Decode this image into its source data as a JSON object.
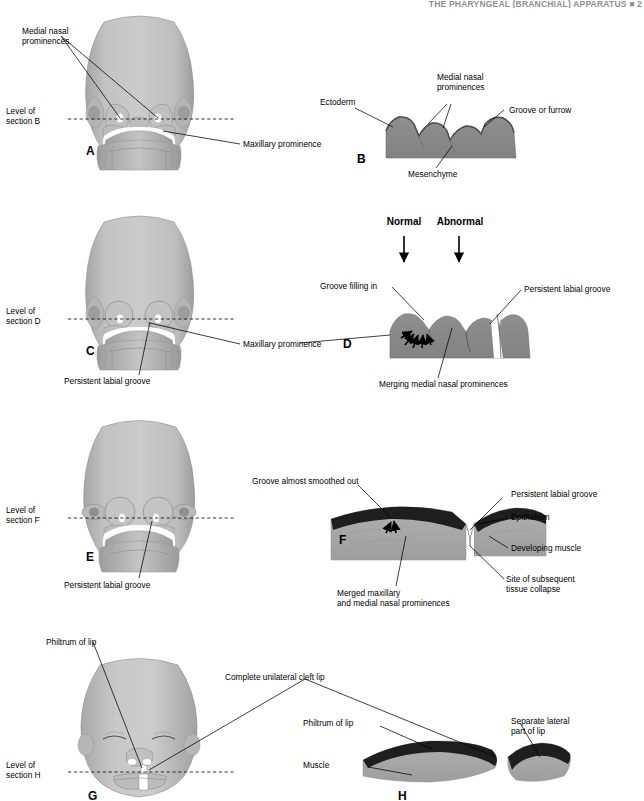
{
  "page": {
    "running_head": "THE PHARYNGEAL (BRANCHIAL) APPARATUS  ■  2",
    "background_color": "#ffffff",
    "ink_color": "#000000"
  },
  "palette": {
    "mesenchyme_gray": "#8a8a8a",
    "head_light_gray": "#c6c6c6",
    "head_mid_gray": "#b0b0b0",
    "head_shadow_gray": "#9a9a9a",
    "epithelium_dark": "#1e1e1e",
    "muscle_gray": "#a8a8a8",
    "label_black": "#000000"
  },
  "panels": [
    {
      "id": "A",
      "letter": "A",
      "type": "embryo-face-frontal",
      "labels": [
        {
          "name": "medial-nasal-prominences",
          "text": "Medial nasal\nprominences"
        },
        {
          "name": "level-of-section-b",
          "text": "Level of\nsection B"
        },
        {
          "name": "maxillary-prominence",
          "text": "Maxillary prominence"
        }
      ]
    },
    {
      "id": "B",
      "letter": "B",
      "type": "histology-cross-section",
      "labels": [
        {
          "name": "ectoderm",
          "text": "Ectoderm"
        },
        {
          "name": "medial-nasal-prominences",
          "text": "Medial nasal\nprominences"
        },
        {
          "name": "groove-or-furrow",
          "text": "Groove or furrow"
        },
        {
          "name": "mesenchyme",
          "text": "Mesenchyme"
        }
      ]
    },
    {
      "id": "C",
      "letter": "C",
      "type": "embryo-face-frontal",
      "labels": [
        {
          "name": "level-of-section-d",
          "text": "Level of\nsection D"
        },
        {
          "name": "maxillary-prominence",
          "text": "Maxillary prominence"
        },
        {
          "name": "persistent-labial-groove",
          "text": "Persistent labial groove"
        }
      ]
    },
    {
      "id": "D",
      "letter": "D",
      "type": "histology-cross-section",
      "headings": [
        {
          "name": "normal-heading",
          "text": "Normal"
        },
        {
          "name": "abnormal-heading",
          "text": "Abnormal"
        }
      ],
      "labels": [
        {
          "name": "groove-filling-in",
          "text": "Groove filling in"
        },
        {
          "name": "persistent-labial-groove",
          "text": "Persistent labial groove"
        },
        {
          "name": "merging-medial-nasal-prominences",
          "text": "Merging medial nasal prominences"
        }
      ]
    },
    {
      "id": "E",
      "letter": "E",
      "type": "embryo-face-frontal",
      "labels": [
        {
          "name": "level-of-section-f",
          "text": "Level of\nsection F"
        },
        {
          "name": "persistent-labial-groove",
          "text": "Persistent labial groove"
        }
      ]
    },
    {
      "id": "F",
      "letter": "F",
      "type": "histology-cross-section",
      "labels": [
        {
          "name": "groove-almost-smoothed-out",
          "text": "Groove almost smoothed out"
        },
        {
          "name": "persistent-labial-groove",
          "text": "Persistent labial groove"
        },
        {
          "name": "epithelium",
          "text": "Epithelium"
        },
        {
          "name": "developing-muscle",
          "text": "Developing muscle"
        },
        {
          "name": "merged-maxillary-and-medial-nasal-prominences",
          "text": "Merged maxillary\nand medial nasal prominences"
        },
        {
          "name": "site-of-subsequent-tissue-collapse",
          "text": "Site of subsequent\ntissue collapse"
        }
      ]
    },
    {
      "id": "G",
      "letter": "G",
      "type": "infant-face-frontal",
      "labels": [
        {
          "name": "philtrum-of-lip",
          "text": "Philtrum of lip"
        },
        {
          "name": "level-of-section-h",
          "text": "Level of\nsection H"
        },
        {
          "name": "complete-unilateral-cleft-lip",
          "text": "Complete unilateral cleft lip"
        }
      ]
    },
    {
      "id": "H",
      "letter": "H",
      "type": "histology-cross-section",
      "labels": [
        {
          "name": "philtrum-of-lip",
          "text": "Philtrum of lip"
        },
        {
          "name": "muscle",
          "text": "Muscle"
        },
        {
          "name": "separate-lateral-part-of-lip",
          "text": "Separate lateral\npart of lip"
        }
      ]
    }
  ]
}
